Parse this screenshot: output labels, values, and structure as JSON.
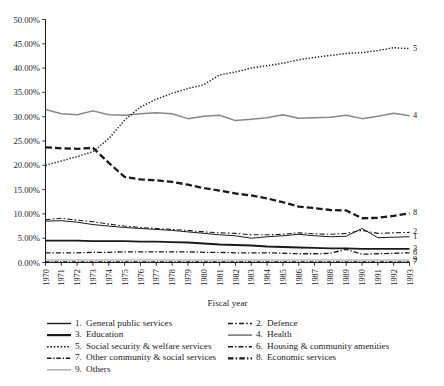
{
  "chart_data": {
    "type": "line",
    "title": "",
    "xlabel": "Fiscal year",
    "ylabel": "",
    "grid": false,
    "legend_position": "bottom",
    "xlim": [
      1970,
      1993
    ],
    "ylim": [
      0,
      50
    ],
    "y_tick_labels": [
      "50.00%",
      "45.00%",
      "40.00%",
      "35.00%",
      "30.00%",
      "25.00%",
      "20.00%",
      "15.00%",
      "10.00%",
      "5.00%",
      "0.00%"
    ],
    "y_tick_values": [
      50,
      45,
      40,
      35,
      30,
      25,
      20,
      15,
      10,
      5,
      0
    ],
    "x": [
      1970,
      1971,
      1972,
      1973,
      1974,
      1975,
      1976,
      1977,
      1978,
      1979,
      1980,
      1981,
      1982,
      1983,
      1984,
      1985,
      1986,
      1987,
      1988,
      1989,
      1990,
      1991,
      1992,
      1993
    ],
    "categories": [
      "1970",
      "1971",
      "1972",
      "1973",
      "1974",
      "1975",
      "1976",
      "1977",
      "1978",
      "1979",
      "1980",
      "1981",
      "1982",
      "1983",
      "1984",
      "1985",
      "1986",
      "1987",
      "1988",
      "1989",
      "1990",
      "1991",
      "1992",
      "1993"
    ],
    "series": [
      {
        "id": "1",
        "name": "General public services",
        "end_label": "1",
        "style": "solid",
        "color": "#1a1a1a",
        "width": 1.0,
        "dash": "none",
        "values": [
          8.5,
          8.6,
          8.3,
          7.8,
          7.5,
          7.2,
          7.0,
          6.8,
          6.6,
          6.3,
          6.0,
          5.7,
          5.5,
          5.0,
          5.3,
          5.5,
          5.8,
          5.5,
          5.3,
          5.4,
          7.0,
          5.1,
          5.2,
          5.3
        ]
      },
      {
        "id": "2",
        "name": "Defence",
        "end_label": "2",
        "style": "dashed-thin",
        "color": "#1a1a1a",
        "width": 1.1,
        "dash": "5,2.2,1.6,2.2",
        "values": [
          8.8,
          9.1,
          8.7,
          8.4,
          7.9,
          7.5,
          7.2,
          7.0,
          6.8,
          6.6,
          6.3,
          6.1,
          6.0,
          5.7,
          5.7,
          5.8,
          6.1,
          5.9,
          5.8,
          6.0,
          6.6,
          6.0,
          6.1,
          6.2
        ]
      },
      {
        "id": "3",
        "name": "Education",
        "end_label": "3",
        "style": "solid-thick",
        "color": "#1a1a1a",
        "width": 1.9,
        "dash": "none",
        "values": [
          4.5,
          4.5,
          4.5,
          4.4,
          4.4,
          4.4,
          4.3,
          4.3,
          4.2,
          4.1,
          3.9,
          3.7,
          3.6,
          3.5,
          3.3,
          3.2,
          3.1,
          3.0,
          2.9,
          2.9,
          2.8,
          2.8,
          2.8,
          2.8
        ]
      },
      {
        "id": "4",
        "name": "Health",
        "end_label": "4",
        "style": "solid-gray",
        "color": "#878787",
        "width": 1.5,
        "dash": "none",
        "values": [
          31.5,
          30.6,
          30.4,
          31.2,
          30.4,
          30.3,
          30.6,
          30.8,
          30.6,
          29.6,
          30.1,
          30.3,
          29.2,
          29.5,
          29.8,
          30.4,
          29.7,
          29.8,
          29.9,
          30.3,
          29.6,
          30.1,
          30.7,
          30.2
        ]
      },
      {
        "id": "5",
        "name": "Social security & welfare services",
        "end_label": "5",
        "style": "dotted",
        "color": "#1a1a1a",
        "width": 1.5,
        "dash": "1.3,1.8",
        "values": [
          20.0,
          20.9,
          21.8,
          22.8,
          25.5,
          29.3,
          32.0,
          33.6,
          34.8,
          35.8,
          36.6,
          38.6,
          39.2,
          40.0,
          40.5,
          41.0,
          41.7,
          42.2,
          42.6,
          43.0,
          43.2,
          43.6,
          44.2,
          44.0
        ]
      },
      {
        "id": "6",
        "name": "Housing & community amenities",
        "end_label": "6",
        "style": "dash-dot",
        "color": "#1a1a1a",
        "width": 1.3,
        "dash": "5,2,1.3,2",
        "values": [
          2.0,
          2.0,
          2.0,
          2.1,
          2.1,
          2.2,
          2.2,
          2.2,
          2.2,
          2.2,
          2.1,
          2.1,
          2.0,
          2.0,
          2.0,
          1.9,
          1.8,
          1.8,
          1.9,
          2.7,
          1.7,
          1.8,
          1.9,
          2.0
        ]
      },
      {
        "id": "7",
        "name": "Other community & social services",
        "end_label": "7",
        "style": "dash-dot-thin",
        "color": "#1a1a1a",
        "width": 1.0,
        "dash": "4,1.8,1.2,1.8",
        "values": [
          0.15,
          0.15,
          0.15,
          0.15,
          0.15,
          0.15,
          0.15,
          0.15,
          0.15,
          0.15,
          0.15,
          0.15,
          0.15,
          0.15,
          0.15,
          0.15,
          0.15,
          0.15,
          0.15,
          0.15,
          0.15,
          0.15,
          0.15,
          0.15
        ]
      },
      {
        "id": "8",
        "name": "Economic services",
        "end_label": "8",
        "style": "dashed-thick",
        "color": "#1a1a1a",
        "width": 2.3,
        "dash": "6.5,3",
        "values": [
          23.7,
          23.5,
          23.4,
          23.6,
          20.5,
          17.6,
          17.1,
          16.9,
          16.6,
          16.0,
          15.3,
          14.8,
          14.2,
          13.8,
          13.2,
          12.4,
          11.5,
          11.2,
          10.8,
          10.7,
          9.1,
          9.2,
          9.6,
          10.1
        ]
      },
      {
        "id": "9",
        "name": "Others",
        "end_label": "9",
        "style": "solid-lightgray",
        "color": "#9a9a9a",
        "width": 1.0,
        "dash": "none",
        "values": [
          0.5,
          0.5,
          0.5,
          0.5,
          0.5,
          0.5,
          0.5,
          0.5,
          0.5,
          0.5,
          0.5,
          0.5,
          0.5,
          0.5,
          0.5,
          0.5,
          0.5,
          0.5,
          0.5,
          0.5,
          0.5,
          0.5,
          0.5,
          0.5
        ]
      }
    ],
    "legend": [
      {
        "num": "1.",
        "label": "General public services",
        "style": "solid",
        "color": "#1a1a1a",
        "width": 1.4,
        "dash": "none",
        "col": 0,
        "row": 0
      },
      {
        "num": "2.",
        "label": "Defence",
        "style": "dashed-thin",
        "color": "#1a1a1a",
        "width": 1.4,
        "dash": "5,2.2,1.6,2.2",
        "col": 1,
        "row": 0
      },
      {
        "num": "3.",
        "label": "Education",
        "style": "solid-thick",
        "color": "#1a1a1a",
        "width": 2.2,
        "dash": "none",
        "col": 0,
        "row": 1
      },
      {
        "num": "4.",
        "label": "Health",
        "style": "solid-gray",
        "color": "#6f6f6f",
        "width": 1.5,
        "dash": "none",
        "col": 1,
        "row": 1
      },
      {
        "num": "5.",
        "label": "Social security & welfare services",
        "style": "dotted",
        "color": "#1a1a1a",
        "width": 1.5,
        "dash": "1.6,1.8",
        "col": 0,
        "row": 2
      },
      {
        "num": "6.",
        "label": "Housing & community amenities",
        "style": "dash-dot",
        "color": "#1a1a1a",
        "width": 1.5,
        "dash": "5,2,1.4,2",
        "col": 1,
        "row": 2
      },
      {
        "num": "7.",
        "label": "Other community & social services",
        "style": "dash-dot-thin",
        "color": "#1a1a1a",
        "width": 1.5,
        "dash": "4.5,1.8,1.3,1.8",
        "col": 0,
        "row": 3
      },
      {
        "num": "8.",
        "label": "Economic services",
        "style": "dashed-thick",
        "color": "#1a1a1a",
        "width": 2.2,
        "dash": "5.5,2.2,1.4,2.2",
        "col": 1,
        "row": 3
      },
      {
        "num": "9.",
        "label": "Others",
        "style": "solid-lightgray",
        "color": "#9a9a9a",
        "width": 1.2,
        "dash": "none",
        "col": 0,
        "row": 4
      }
    ]
  }
}
